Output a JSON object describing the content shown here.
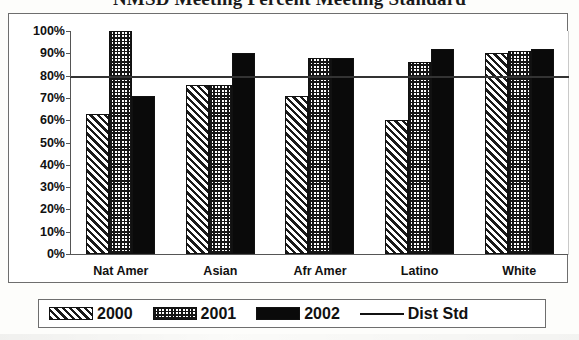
{
  "title": "NMSD Meeting Percent Meeting Standard",
  "legend": {
    "items": [
      {
        "label": "2000",
        "pattern": "diagonal-hatch"
      },
      {
        "label": "2001",
        "pattern": "checkered-dots"
      },
      {
        "label": "2002",
        "pattern": "solid-black"
      },
      {
        "label": "Dist Std",
        "pattern": "line"
      }
    ]
  },
  "axis": {
    "y_ticks": [
      "100%",
      "90%",
      "80%",
      "70%",
      "60%",
      "50%",
      "40%",
      "30%",
      "20%",
      "10%",
      "0%"
    ]
  },
  "chart_data": {
    "type": "bar",
    "title": "NMSD Meeting Percent Meeting Standard",
    "xlabel": "",
    "ylabel": "",
    "ylim": [
      0,
      100
    ],
    "ytick_values": [
      0,
      10,
      20,
      30,
      40,
      50,
      60,
      70,
      80,
      90,
      100
    ],
    "ytick_labels": [
      "0%",
      "10%",
      "20%",
      "30%",
      "40%",
      "50%",
      "60%",
      "70%",
      "80%",
      "90%",
      "100%"
    ],
    "grid": false,
    "legend_position": "bottom",
    "categories": [
      "Nat Amer",
      "Asian",
      "Afr Amer",
      "Latino",
      "White"
    ],
    "series": [
      {
        "name": "2000",
        "values": [
          63,
          76,
          71,
          60,
          90
        ]
      },
      {
        "name": "2001",
        "values": [
          100,
          76,
          88,
          86,
          91
        ]
      },
      {
        "name": "2002",
        "values": [
          71,
          90,
          88,
          92,
          92
        ]
      }
    ],
    "reference_line": {
      "name": "Dist Std",
      "value": 80
    }
  }
}
